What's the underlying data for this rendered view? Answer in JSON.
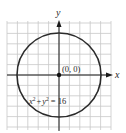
{
  "figure": {
    "type": "circle-graph",
    "axes": {
      "x_label": "x",
      "y_label": "y",
      "x_range": [
        -5,
        5
      ],
      "y_range": [
        -5,
        5
      ],
      "grid": true
    },
    "center": {
      "x": 0,
      "y": 0
    },
    "center_label": "(0, 0)",
    "radius": 4,
    "equation": {
      "x_term": "x",
      "x_exp": "2",
      "plus": "+",
      "y_term": "y",
      "y_exp": "2",
      "equals": "=",
      "rhs": "16",
      "full": "x² + y² = 16"
    },
    "colors": {
      "grid": "#c8c8c8",
      "axis": "#1a1a1a",
      "curve": "#2b2b2b",
      "background": "#ffffff"
    }
  }
}
